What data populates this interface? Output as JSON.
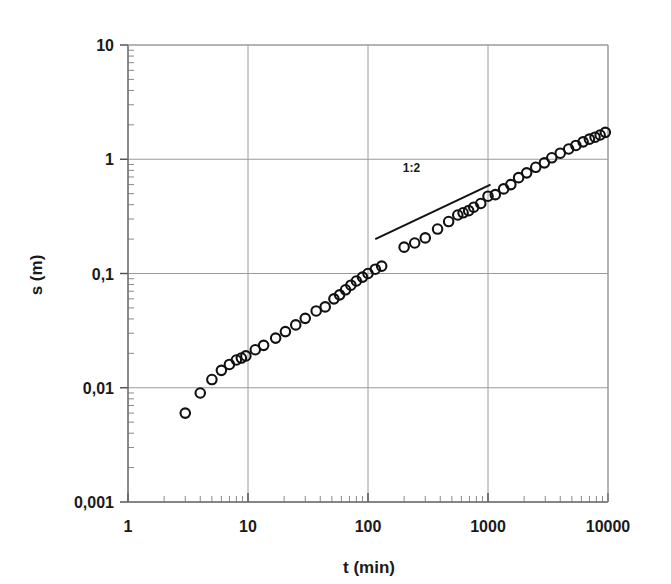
{
  "chart_data": {
    "type": "scatter",
    "title": "",
    "subtitle": "",
    "xlabel": "t (min)",
    "ylabel": "s (m)",
    "xscale": "log",
    "yscale": "log",
    "xlim": [
      1,
      10000
    ],
    "ylim": [
      0.001,
      10
    ],
    "grid": true,
    "legend": false,
    "xticks": [
      1,
      10,
      100,
      1000,
      10000
    ],
    "xticklabels": [
      "1",
      "10",
      "100",
      "1000",
      "10000"
    ],
    "yticks": [
      0.001,
      0.01,
      0.1,
      1,
      10
    ],
    "yticklabels": [
      "0,001",
      "0,01",
      "0,1",
      "1",
      "10"
    ],
    "minor_ticks": true,
    "marker_style": "open-circle",
    "marker_size_px": 9.5,
    "series": [
      {
        "name": "settlement",
        "x": [
          3.0,
          4.0,
          5.0,
          6.0,
          7.0,
          8.0,
          8.8,
          9.6,
          11.5,
          13.5,
          17.0,
          20.5,
          25.0,
          30.0,
          37.0,
          44.0,
          52.0,
          58.0,
          65.0,
          72.0,
          80.0,
          90.0,
          100.0,
          115.0,
          130.0,
          200.0,
          245.0,
          300.0,
          380.0,
          470.0,
          560.0,
          620.0,
          690.0,
          760.0,
          870.0,
          1000.0,
          1150.0,
          1350.0,
          1550.0,
          1800.0,
          2100.0,
          2500.0,
          2950.0,
          3400.0,
          4000.0,
          4700.0,
          5400.0,
          6200.0,
          7000.0,
          7800.0,
          8600.0,
          9500.0
        ],
        "y": [
          0.006,
          0.009,
          0.0118,
          0.0142,
          0.016,
          0.0175,
          0.0182,
          0.019,
          0.0215,
          0.0235,
          0.0272,
          0.031,
          0.0355,
          0.0405,
          0.047,
          0.051,
          0.06,
          0.065,
          0.072,
          0.079,
          0.086,
          0.093,
          0.1,
          0.109,
          0.116,
          0.17,
          0.185,
          0.205,
          0.245,
          0.285,
          0.325,
          0.34,
          0.355,
          0.38,
          0.41,
          0.475,
          0.49,
          0.55,
          0.6,
          0.69,
          0.76,
          0.85,
          0.93,
          1.03,
          1.13,
          1.23,
          1.32,
          1.42,
          1.5,
          1.56,
          1.63,
          1.72
        ]
      }
    ],
    "annotations": [
      {
        "name": "slope-1-2",
        "text": "1:2",
        "text_x": 230,
        "text_y": 0.78,
        "line": {
          "x1": 115,
          "y1": 0.2,
          "x2": 1050,
          "y2": 0.6
        }
      }
    ]
  },
  "axes": {
    "x_axis_title": "t (min)",
    "y_axis_title": "s (m)"
  }
}
